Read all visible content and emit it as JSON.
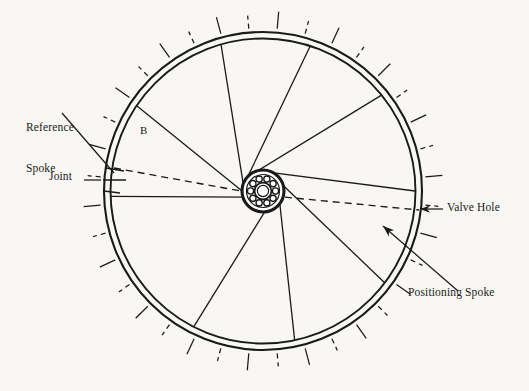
{
  "figure": {
    "background_color": "#f8f7f4",
    "line_color": "#1a1a1a"
  },
  "labels": {
    "reference_spoke_line1": "Reference",
    "reference_spoke_line2": "Spoke",
    "joint": "Joint",
    "b": "B",
    "valve_hole": "Valve Hole",
    "positioning_spoke": "Positioning Spoke"
  },
  "geometry": {
    "center_x": 263,
    "center_y": 191,
    "rim_outer_radius": 159,
    "rim_inner_radius": 152,
    "tick_inner_radius": 163,
    "tick_outer_radius": 180,
    "tick_count": 36,
    "hub_outer_radius": 21,
    "hub_ring_radius": 16,
    "hub_bore_outer_radius": 9,
    "hub_bore_inner_radius": 6,
    "hub_hole_count": 10,
    "hub_hole_orbit_radius": 12.5,
    "hub_hole_radius": 3.1
  },
  "chart_data": {
    "type": "diagram",
    "spokes": [
      {
        "id": 1,
        "hub_angle_deg": 252,
        "rim_angle_deg": 268,
        "label": "spoke-1"
      },
      {
        "id": 2,
        "hub_angle_deg": 268,
        "rim_angle_deg": 304,
        "label": "spoke-2"
      },
      {
        "id": 3,
        "hub_angle_deg": 284,
        "rim_angle_deg": 344,
        "label": "spoke-3"
      },
      {
        "id": 4,
        "hub_angle_deg": 300,
        "rim_angle_deg": 18,
        "label": "spoke-4"
      },
      {
        "id": 5,
        "hub_angle_deg": 325,
        "rim_angle_deg": 51,
        "label": "spoke-5"
      },
      {
        "id": 6,
        "hub_angle_deg": 352,
        "rim_angle_deg": 90,
        "label": "spoke-6"
      },
      {
        "id": 7,
        "hub_angle_deg": 18,
        "rim_angle_deg": 127,
        "label": "spoke-7"
      },
      {
        "id": 8,
        "hub_angle_deg": 44,
        "rim_angle_deg": 168,
        "label": "spoke-8"
      },
      {
        "id": 9,
        "hub_angle_deg": 70,
        "rim_angle_deg": 207,
        "label": "spoke-9"
      }
    ],
    "dashed_reference_line": {
      "from_angle_deg": 152,
      "to_angle_deg": 353,
      "description": "Dashed datum line from reference spoke joint through hub to valve hole"
    },
    "leader_lines": [
      {
        "name": "reference-spoke-leader",
        "from": [
          60,
          112
        ],
        "to": [
          113,
          172
        ]
      },
      {
        "name": "joint-leader",
        "from": [
          84,
          180
        ],
        "to": [
          122,
          180
        ]
      },
      {
        "name": "valve-hole-leader",
        "from": [
          443,
          209
        ],
        "to": [
          418,
          209
        ]
      },
      {
        "name": "positioning-spoke-leader",
        "from": [
          457,
          290
        ],
        "to": [
          382,
          225
        ]
      }
    ]
  }
}
